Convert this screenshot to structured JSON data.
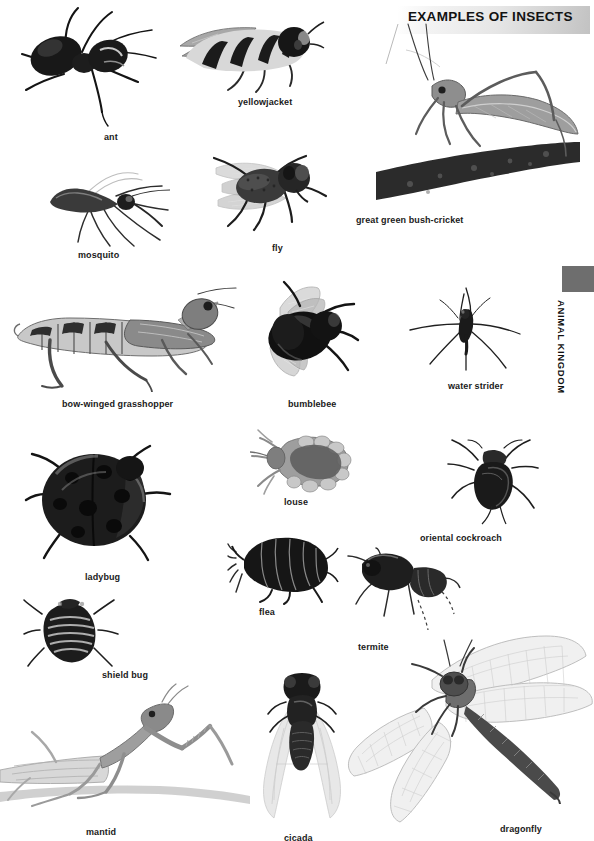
{
  "document": {
    "title": "EXAMPLES OF INSECTS",
    "section_tab": "ANIMAL KINGDOM",
    "page_number": "",
    "background_color": "#ffffff",
    "ink_color": "#1a1a1a",
    "tab_color": "#6e6e6e"
  },
  "figures": [
    {
      "id": "ant",
      "label": "ant",
      "cap_x": 104,
      "cap_y": 132,
      "x": 4,
      "y": 8,
      "w": 160,
      "h": 118
    },
    {
      "id": "yellowjacket",
      "label": "yellowjacket",
      "cap_x": 238,
      "cap_y": 97,
      "x": 172,
      "y": 12,
      "w": 152,
      "h": 78
    },
    {
      "id": "mosquito",
      "label": "mosquito",
      "cap_x": 78,
      "cap_y": 250,
      "x": 46,
      "y": 160,
      "w": 128,
      "h": 84
    },
    {
      "id": "fly",
      "label": "fly",
      "cap_x": 272,
      "cap_y": 243,
      "x": 188,
      "y": 140,
      "w": 140,
      "h": 92
    },
    {
      "id": "bush-cricket",
      "label": "great green bush-cricket",
      "cap_x": 356,
      "cap_y": 215,
      "x": 370,
      "y": 22,
      "w": 210,
      "h": 190
    },
    {
      "id": "grasshopper",
      "label": "bow-winged grasshopper",
      "cap_x": 62,
      "cap_y": 399,
      "x": 12,
      "y": 280,
      "w": 224,
      "h": 110
    },
    {
      "id": "bumblebee",
      "label": "bumblebee",
      "cap_x": 288,
      "cap_y": 399,
      "x": 254,
      "y": 282,
      "w": 110,
      "h": 98
    },
    {
      "id": "water-strider",
      "label": "water strider",
      "cap_x": 448,
      "cap_y": 381,
      "x": 408,
      "y": 284,
      "w": 112,
      "h": 86
    },
    {
      "id": "louse",
      "label": "louse",
      "cap_x": 284,
      "cap_y": 497,
      "x": 250,
      "y": 428,
      "w": 104,
      "h": 66
    },
    {
      "id": "cockroach",
      "label": "oriental cockroach",
      "cap_x": 420,
      "cap_y": 533,
      "x": 448,
      "y": 440,
      "w": 90,
      "h": 84
    },
    {
      "id": "ladybug",
      "label": "ladybug",
      "cap_x": 85,
      "cap_y": 572,
      "x": 26,
      "y": 438,
      "w": 144,
      "h": 124
    },
    {
      "id": "flea",
      "label": "flea",
      "cap_x": 259,
      "cap_y": 607,
      "x": 228,
      "y": 530,
      "w": 108,
      "h": 72
    },
    {
      "id": "termite",
      "label": "termite",
      "cap_x": 358,
      "cap_y": 642,
      "x": 348,
      "y": 548,
      "w": 110,
      "h": 84
    },
    {
      "id": "shield-bug",
      "label": "shield bug",
      "cap_x": 102,
      "cap_y": 670,
      "x": 24,
      "y": 598,
      "w": 94,
      "h": 68
    },
    {
      "id": "mantid",
      "label": "mantid",
      "cap_x": 86,
      "cap_y": 827,
      "x": 0,
      "y": 684,
      "w": 248,
      "h": 140
    },
    {
      "id": "cicada",
      "label": "cicada",
      "cap_x": 284,
      "cap_y": 833,
      "x": 250,
      "y": 672,
      "w": 102,
      "h": 148
    },
    {
      "id": "dragonfly",
      "label": "dragonfly",
      "cap_x": 500,
      "cap_y": 824,
      "x": 346,
      "y": 636,
      "w": 244,
      "h": 186
    }
  ]
}
